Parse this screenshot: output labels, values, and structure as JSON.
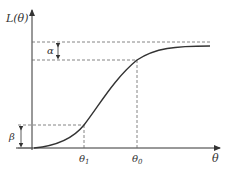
{
  "diagram": {
    "y_axis_label": "L(θ)",
    "x_axis_label": "θ",
    "ticks": [
      {
        "label": "θ",
        "sub": "1"
      },
      {
        "label": "θ",
        "sub": "0"
      }
    ],
    "annotations": {
      "alpha": "α",
      "beta": "β"
    },
    "curve": "sigmoid (S-shaped) rising from origin to plateau",
    "colors": {
      "curve": "#333333",
      "axes": "#333333",
      "dashed": "#555555"
    }
  }
}
